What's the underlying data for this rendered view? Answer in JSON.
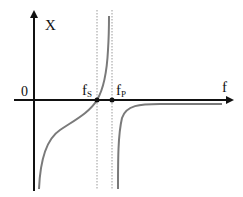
{
  "diagram": {
    "axes": {
      "y_label": "X",
      "x_label": "f",
      "origin_label": "0"
    },
    "markers": [
      {
        "id": "fs",
        "base": "f",
        "sub": "S"
      },
      {
        "id": "fp",
        "base": "f",
        "sub": "P"
      }
    ],
    "colors": {
      "axis": "#111111",
      "curve": "#7a7a7a",
      "guide": "#9a9a9a",
      "background": "#ffffff"
    }
  }
}
